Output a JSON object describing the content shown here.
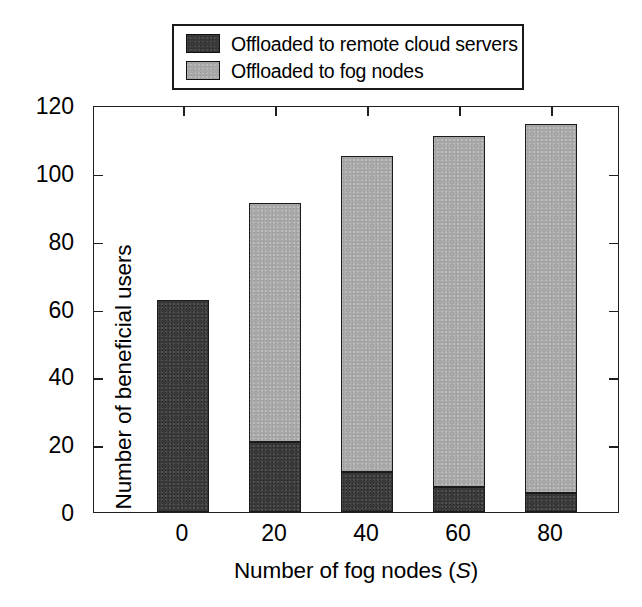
{
  "chart_data": {
    "type": "bar",
    "subtype": "stacked",
    "title": "",
    "xlabel": "Number of fog nodes (S)",
    "xlabel_plain": "Number of fog nodes (",
    "xlabel_italic": "S",
    "xlabel_tail": ")",
    "ylabel": "Number of beneficial users",
    "categories": [
      "0",
      "20",
      "40",
      "60",
      "80"
    ],
    "x_tick_labels": [
      "0",
      "20",
      "40",
      "60",
      "80"
    ],
    "y_tick_labels": [
      "0",
      "20",
      "40",
      "60",
      "80",
      "100",
      "120"
    ],
    "y_ticks": [
      0,
      20,
      40,
      60,
      80,
      100,
      120
    ],
    "ylim": [
      0,
      120
    ],
    "grid": false,
    "series": [
      {
        "name": "Offloaded to remote cloud servers",
        "color": "#3a3a3a",
        "values": [
          62.5,
          20.5,
          11.8,
          7.5,
          5.5
        ]
      },
      {
        "name": "Offloaded to fog nodes",
        "color": "#a8a8a8",
        "values": [
          0,
          70.5,
          93.2,
          103.5,
          109.0
        ]
      }
    ],
    "totals": [
      62.5,
      91.0,
      105.0,
      111.0,
      114.5
    ],
    "legend": {
      "position": "top",
      "entries": [
        {
          "label": "Offloaded to remote cloud servers",
          "swatch": "dark"
        },
        {
          "label": "Offloaded to fog nodes",
          "swatch": "light"
        }
      ]
    }
  },
  "legend": {
    "item0": "Offloaded to remote cloud servers",
    "item1": "Offloaded to fog nodes"
  },
  "axes": {
    "y_title": "Number of beneficial users",
    "x_title_prefix": "Number of fog nodes (",
    "x_title_italic": "S",
    "x_title_suffix": ")"
  }
}
